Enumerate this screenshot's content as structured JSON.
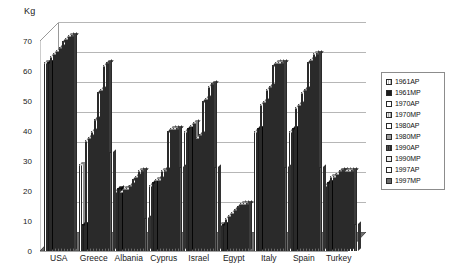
{
  "chart_data": {
    "type": "bar",
    "title": "",
    "subtitle": "",
    "ylabel": "Kg",
    "xlabel": "",
    "ylim": [
      0,
      70
    ],
    "yticks": [
      0,
      10,
      20,
      30,
      40,
      50,
      60,
      70
    ],
    "grid": true,
    "legend_position": "right",
    "three_d": true,
    "categories": [
      "USA",
      "Greece",
      "Albania",
      "Cyprus",
      "Israel",
      "Egypt",
      "Italy",
      "Spain",
      "Turkey"
    ],
    "series": [
      {
        "name": "1961AP",
        "values": [
          63,
          29,
          20,
          22,
          40,
          9,
          40,
          40,
          22
        ]
      },
      {
        "name": "1961MP",
        "values": [
          63,
          9,
          21,
          23,
          41,
          9,
          41,
          41,
          23
        ]
      },
      {
        "name": "1970AP",
        "values": [
          65,
          37,
          20,
          24,
          42,
          11,
          49,
          48,
          25
        ]
      },
      {
        "name": "1970MP",
        "values": [
          66,
          38,
          21,
          24,
          43,
          12,
          50,
          49,
          25
        ]
      },
      {
        "name": "1980AP",
        "values": [
          67,
          40,
          21,
          27,
          38,
          13,
          54,
          53,
          26
        ]
      },
      {
        "name": "1980MP",
        "values": [
          68,
          44,
          22,
          27,
          39,
          14,
          55,
          54,
          27
        ]
      },
      {
        "name": "1990AP",
        "values": [
          70,
          53,
          24,
          40,
          50,
          15,
          62,
          63,
          27
        ]
      },
      {
        "name": "1990MP",
        "values": [
          71,
          54,
          25,
          41,
          51,
          16,
          63,
          64,
          27
        ]
      },
      {
        "name": "1997AP",
        "values": [
          72,
          62,
          27,
          41,
          55,
          16,
          63,
          66,
          27
        ]
      },
      {
        "name": "1997MP",
        "values": [
          72,
          63,
          27,
          41,
          56,
          16,
          63,
          66,
          27
        ]
      }
    ],
    "extra_bars": [
      {
        "category": "Greece",
        "value": 33
      },
      {
        "category": "Albania",
        "value": 11
      },
      {
        "category": "Cyprus",
        "value": 28
      },
      {
        "category": "Israel",
        "value": 28
      },
      {
        "category": "Italy",
        "value": 28
      },
      {
        "category": "Spain",
        "value": 28
      },
      {
        "category": "Turkey",
        "value": 9
      }
    ]
  },
  "legend": {
    "items": [
      {
        "label": "1961AP",
        "swatch": "white-dot"
      },
      {
        "label": "1961MP",
        "swatch": "black"
      },
      {
        "label": "1970AP",
        "swatch": "white"
      },
      {
        "label": "1970MP",
        "swatch": "light-hatch"
      },
      {
        "label": "1980AP",
        "swatch": "white"
      },
      {
        "label": "1980MP",
        "swatch": "mid-gray"
      },
      {
        "label": "1990AP",
        "swatch": "dark-hatch"
      },
      {
        "label": "1990MP",
        "swatch": "very-light"
      },
      {
        "label": "1997AP",
        "swatch": "white"
      },
      {
        "label": "1997MP",
        "swatch": "dark-gray"
      }
    ]
  },
  "colors": {
    "grid": "#b6b6b6",
    "axis": "#9a9a9a",
    "floor": "#6f6f6f",
    "wall": "#ffffff",
    "bar_outline": "#2a2a2a",
    "text": "#1a1a1a"
  }
}
